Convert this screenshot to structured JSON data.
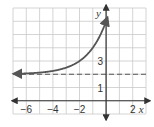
{
  "chart_data": {
    "type": "line",
    "title": "",
    "xlabel": "x",
    "ylabel": "y",
    "xlim": [
      -7,
      3
    ],
    "ylim": [
      -1,
      7
    ],
    "grid": true,
    "function": "y = 2^(x+2) + 2",
    "series": [
      {
        "name": "exponential curve",
        "x": [
          -7,
          -6,
          -5,
          -4,
          -3,
          -2,
          -1,
          0,
          0.1
        ],
        "y": [
          2.03125,
          2.0625,
          2.125,
          2.25,
          2.5,
          3,
          4,
          6,
          6.29
        ]
      }
    ],
    "asymptote": {
      "type": "horizontal",
      "y": 2,
      "style": "dashed"
    },
    "x_tick_labels": [
      {
        "value": -6,
        "label": "−6"
      },
      {
        "value": -4,
        "label": "−4"
      },
      {
        "value": -2,
        "label": "−2"
      },
      {
        "value": 2,
        "label": "2"
      }
    ],
    "y_tick_labels": [
      {
        "value": 1,
        "label": "1"
      },
      {
        "value": 3,
        "label": "3"
      }
    ],
    "colors": {
      "curve": "#555555",
      "grid": "#c9c9c9",
      "axis": "#333333"
    }
  }
}
